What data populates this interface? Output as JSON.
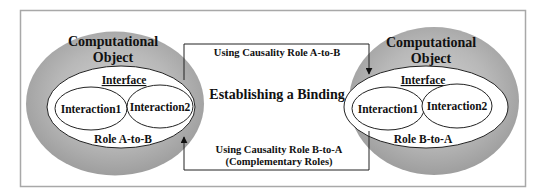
{
  "diagram": {
    "title": "Establishing a Binding",
    "colors": {
      "background": "#ffffff",
      "frame": "#a8a8a8",
      "object_fill": "#a9a9a9",
      "object_fill_light": "#cfcfcf",
      "interface_fill": "#ffffff",
      "stroke": "#222222",
      "text": "#111111"
    },
    "left_object": {
      "title_line1": "Computational",
      "title_line2": "Object",
      "interface_label": "Interface",
      "interactions": [
        "Interaction1",
        "Interaction2"
      ],
      "role_label": "Role A-to-B"
    },
    "right_object": {
      "title_line1": "Computational",
      "title_line2": "Object",
      "interface_label": "Interface",
      "interactions": [
        "Interaction1",
        "Interaction2"
      ],
      "role_label": "Role B-to-A"
    },
    "connector": {
      "top_label": "Using Causality Role A-to-B",
      "bottom_label_line1": "Using Causality Role B-to-A",
      "bottom_label_line2": "(Complementary Roles)"
    }
  }
}
